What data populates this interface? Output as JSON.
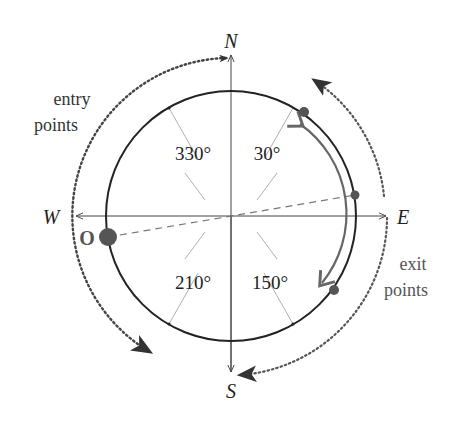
{
  "diagram": {
    "center": {
      "x": 231,
      "y": 216
    },
    "radius": 125,
    "outer_radius": 158,
    "colors": {
      "circle": "#222222",
      "axes": "#444444",
      "ticks": "#999999",
      "points": "#555555",
      "path_arc": "#666666",
      "dotted": "#555555",
      "text": "#333333"
    },
    "compass": {
      "north": "N",
      "south": "S",
      "east": "E",
      "west": "W"
    },
    "angle_labels": [
      {
        "text": "330°",
        "angle": 330
      },
      {
        "text": "30°",
        "angle": 30
      },
      {
        "text": "210°",
        "angle": 210
      },
      {
        "text": "150°",
        "angle": 150
      }
    ],
    "origin_label": "O",
    "entry_label": {
      "line1": "entry",
      "line2": "points"
    },
    "exit_label": {
      "line1": "exit",
      "line2": "points"
    }
  }
}
